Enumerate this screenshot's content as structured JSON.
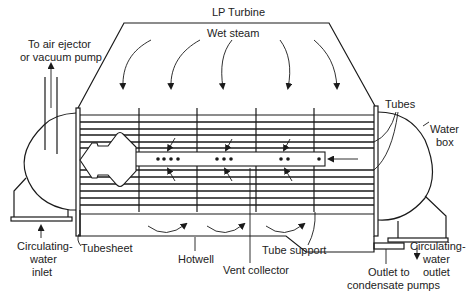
{
  "diagram": {
    "title": "LP Turbine",
    "type": "Surface condenser cross-section schematic",
    "labels": {
      "lp_turbine": "LP Turbine",
      "wet_steam": "Wet steam",
      "air_ejector_line1": "To air ejector",
      "air_ejector_line2": "or vacuum pump",
      "tubes": "Tubes",
      "water_box_line1": "Water",
      "water_box_line2": "box",
      "cw_inlet_line1": "Circulating-",
      "cw_inlet_line2": "water",
      "cw_inlet_line3": "inlet",
      "tubesheet": "Tubesheet",
      "hotwell": "Hotwell",
      "vent_collector": "Vent collector",
      "tube_support": "Tube support",
      "cw_outlet_line1": "Circulating-",
      "cw_outlet_line2": "water",
      "cw_outlet_line3": "outlet",
      "outlet_line1": "Outlet to",
      "outlet_line2": "condensate pumps"
    },
    "components": [
      {
        "id": "lp-turbine-exhaust",
        "label": "LP Turbine"
      },
      {
        "id": "steam-flow-arrows",
        "label": "Wet steam",
        "count": 6
      },
      {
        "id": "tube-bundle",
        "label": "Tubes"
      },
      {
        "id": "vent-collector",
        "label": "Vent collector",
        "dot_groups": [
          4,
          3,
          2,
          1
        ]
      },
      {
        "id": "tube-supports",
        "label": "Tube support",
        "count": 4
      },
      {
        "id": "tubesheet",
        "label": "Tubesheet"
      },
      {
        "id": "water-box-left",
        "label": "Circulating-water inlet"
      },
      {
        "id": "water-box-right",
        "label": "Water box"
      },
      {
        "id": "hotwell",
        "label": "Hotwell"
      },
      {
        "id": "air-ejector-pipe",
        "label": "To air ejector or vacuum pump"
      },
      {
        "id": "condensate-outlet",
        "label": "Outlet to condensate pumps"
      }
    ]
  }
}
